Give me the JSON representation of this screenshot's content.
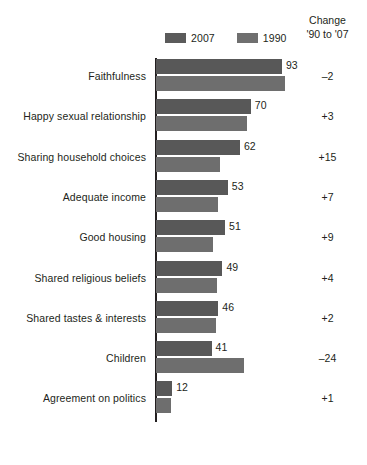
{
  "legend": {
    "entries": [
      {
        "label": "2007",
        "color": "#585858",
        "swatch_name": "legend-swatch-2007"
      },
      {
        "label": "1990",
        "color": "#6e6e6e",
        "swatch_name": "legend-swatch-1990"
      }
    ]
  },
  "change_header": {
    "line1": "Change",
    "line2": "'90 to '07"
  },
  "chart_data": {
    "type": "bar",
    "orientation": "horizontal",
    "title": "",
    "subtitle": "",
    "xlabel": "",
    "ylabel": "",
    "xlim": [
      0,
      100
    ],
    "grid": false,
    "legend_position": "top",
    "categories": [
      "Faithfulness",
      "Happy sexual relationship",
      "Sharing household choices",
      "Adequate income",
      "Good housing",
      "Shared religious beliefs",
      "Shared tastes & interests",
      "Children",
      "Agreement on politics"
    ],
    "series": [
      {
        "name": "2007",
        "color": "#585858",
        "values": [
          93,
          70,
          62,
          53,
          51,
          49,
          46,
          41,
          12
        ]
      },
      {
        "name": "1990",
        "color": "#6e6e6e",
        "values": [
          95,
          67,
          47,
          46,
          42,
          45,
          44,
          65,
          11
        ]
      }
    ],
    "value_labels": [
      "93",
      "70",
      "62",
      "53",
      "51",
      "49",
      "46",
      "41",
      "12"
    ],
    "change_column_header": "Change '90 to '07",
    "change_values": [
      "–2",
      "+3",
      "+15",
      "+7",
      "+9",
      "+4",
      "+2",
      "–24",
      "+1"
    ]
  }
}
